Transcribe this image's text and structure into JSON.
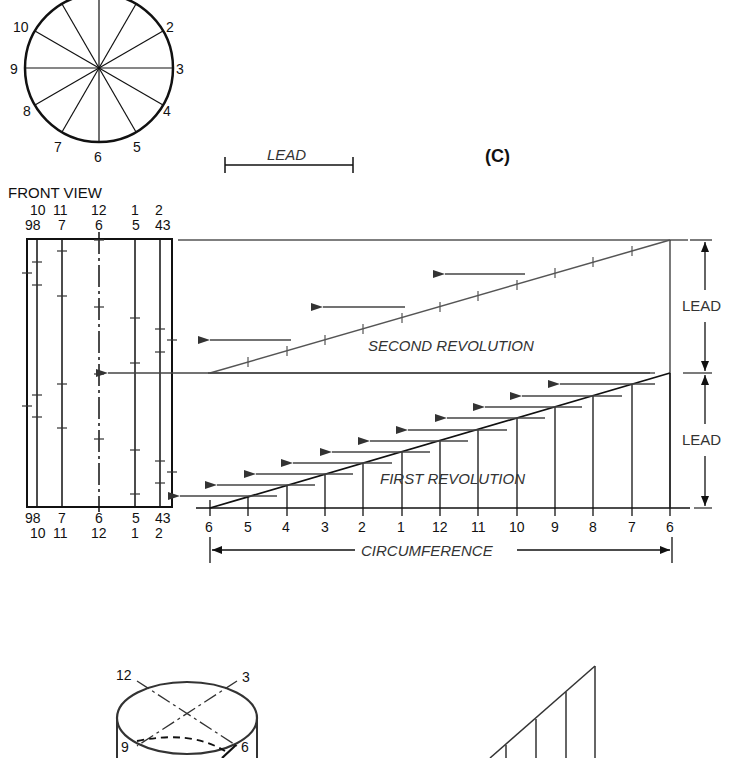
{
  "figure_label": "(C)",
  "lead_scale": {
    "label": "LEAD"
  },
  "top_view": {
    "labels": [
      "2",
      "3",
      "4",
      "5",
      "6",
      "7",
      "8",
      "9",
      "10"
    ]
  },
  "front_view": {
    "title": "FRONT VIEW",
    "top_row1": [
      "10",
      "11",
      "12",
      "1",
      "2"
    ],
    "top_row2": [
      "98",
      "7",
      "6",
      "5",
      "43"
    ],
    "bottom_row1": [
      "98",
      "7",
      "6",
      "5",
      "43"
    ],
    "bottom_row2": [
      "10",
      "11",
      "12",
      "1",
      "2"
    ]
  },
  "development": {
    "second_revolution_label": "SECOND REVOLUTION",
    "first_revolution_label": "FIRST REVOLUTION",
    "lead_upper": "LEAD",
    "lead_lower": "LEAD",
    "circumference_label": "CIRCUMFERENCE",
    "baseline_labels": [
      "6",
      "5",
      "4",
      "3",
      "2",
      "1",
      "12",
      "11",
      "10",
      "9",
      "8",
      "7",
      "6"
    ]
  },
  "pictorial": {
    "labels": [
      "12",
      "3",
      "9",
      "6"
    ]
  },
  "colors": {
    "line": "#1a1a1a",
    "gray_line": "#555555",
    "background": "#ffffff"
  }
}
